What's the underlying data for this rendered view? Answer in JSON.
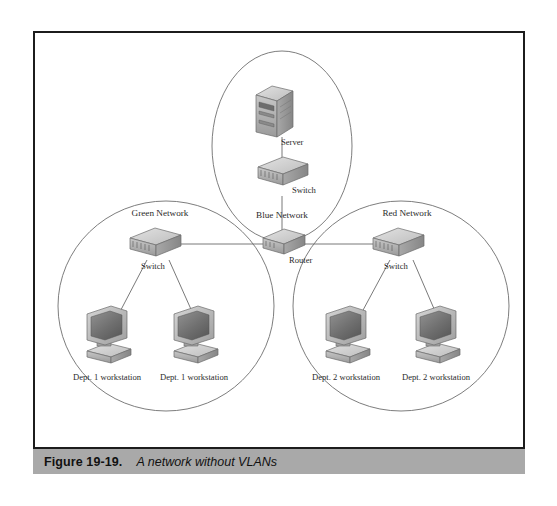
{
  "figure": {
    "caption_label": "Figure 19-19.",
    "caption_text": "A network without VLANs"
  },
  "diagram": {
    "type": "network-topology",
    "title": "A network without VLANs",
    "clouds": [
      {
        "id": "blue",
        "label": "Blue Network",
        "cx": 247,
        "cy": 113,
        "rx": 70,
        "ry": 95
      },
      {
        "id": "green",
        "label": "Green Network",
        "cx": 131,
        "cy": 273,
        "rx": 108,
        "ry": 105
      },
      {
        "id": "red",
        "label": "Red Network",
        "cx": 366,
        "cy": 273,
        "rx": 108,
        "ry": 105
      }
    ],
    "nodes": [
      {
        "id": "server",
        "type": "server",
        "label": "Server",
        "network": "blue",
        "x": 247,
        "y": 78
      },
      {
        "id": "blue-switch",
        "type": "switch",
        "label": "Switch",
        "network": "blue",
        "x": 247,
        "y": 143
      },
      {
        "id": "router",
        "type": "router",
        "label": "Router",
        "network": "core",
        "x": 247,
        "y": 211
      },
      {
        "id": "green-switch",
        "type": "switch",
        "label": "Switch",
        "network": "green",
        "x": 117,
        "y": 213
      },
      {
        "id": "green-ws-1",
        "type": "workstation",
        "label": "Dept. 1 workstation",
        "network": "green",
        "x": 71,
        "y": 303
      },
      {
        "id": "green-ws-2",
        "type": "workstation",
        "label": "Dept. 1 workstation",
        "network": "green",
        "x": 158,
        "y": 303
      },
      {
        "id": "red-switch",
        "type": "switch",
        "label": "Switch",
        "network": "red",
        "x": 360,
        "y": 213
      },
      {
        "id": "red-ws-1",
        "type": "workstation",
        "label": "Dept. 2 workstation",
        "network": "red",
        "x": 310,
        "y": 303
      },
      {
        "id": "red-ws-2",
        "type": "workstation",
        "label": "Dept. 2 workstation",
        "network": "red",
        "x": 400,
        "y": 303
      }
    ],
    "links": [
      {
        "from": "server",
        "to": "blue-switch"
      },
      {
        "from": "blue-switch",
        "to": "router"
      },
      {
        "from": "router",
        "to": "green-switch"
      },
      {
        "from": "router",
        "to": "red-switch"
      },
      {
        "from": "green-switch",
        "to": "green-ws-1"
      },
      {
        "from": "green-switch",
        "to": "green-ws-2"
      },
      {
        "from": "red-switch",
        "to": "red-ws-1"
      },
      {
        "from": "red-switch",
        "to": "red-ws-2"
      }
    ],
    "colors": {
      "frame_border": "#1c1c1c",
      "caption_background": "#a9a9a9",
      "cloud_outline": "#6e6e6e",
      "link_line": "#6a6a6a",
      "device_fill_light": "#d8d8d8",
      "device_fill_mid": "#b4b4b4",
      "device_fill_dark": "#8e8e8e",
      "label_text": "#2a2a2a",
      "page_background": "#ffffff"
    }
  }
}
